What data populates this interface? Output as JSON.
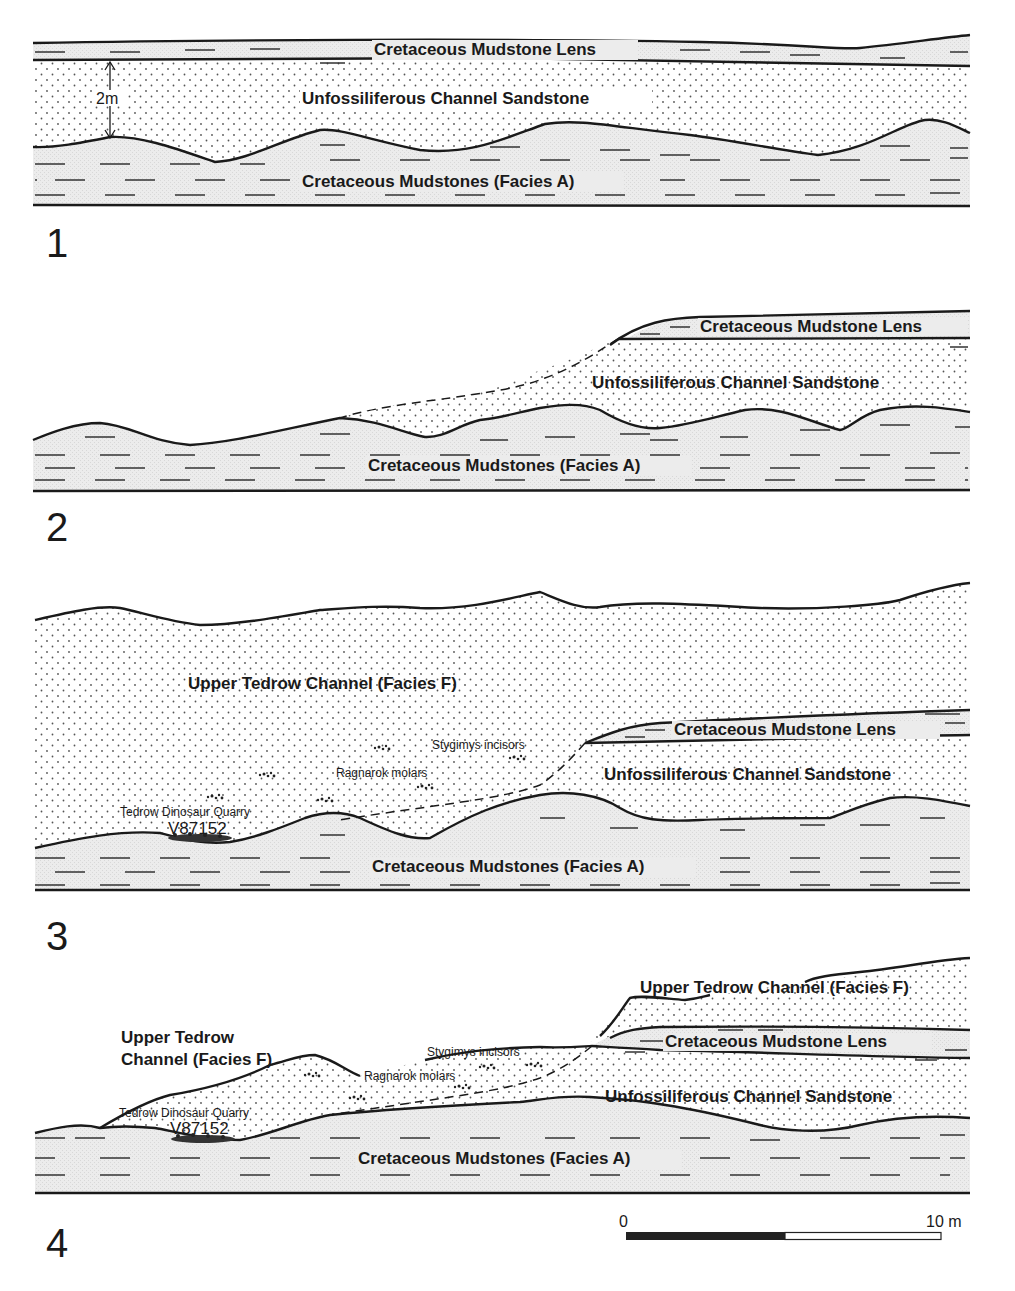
{
  "figure": {
    "panels": [
      {
        "number": "1",
        "labels": {
          "lens": "Cretaceous Mudstone Lens",
          "sandstone": "Unfossiliferous Channel Sandstone",
          "mudstones": "Cretaceous Mudstones (Facies A)",
          "thickness": "2m"
        }
      },
      {
        "number": "2",
        "labels": {
          "lens": "Cretaceous Mudstone Lens",
          "sandstone": "Unfossiliferous Channel Sandstone",
          "mudstones": "Cretaceous Mudstones (Facies A)"
        }
      },
      {
        "number": "3",
        "labels": {
          "upper_channel": "Upper Tedrow Channel (Facies F)",
          "lens": "Cretaceous Mudstone Lens",
          "sandstone": "Unfossiliferous Channel Sandstone",
          "mudstones": "Cretaceous Mudstones (Facies A)",
          "stygimys": "Stygimys incisors",
          "ragnarok": "Ragnarok molars",
          "quarry": "Tedrow Dinosaur Quarry",
          "locality": "V87152"
        }
      },
      {
        "number": "4",
        "labels": {
          "upper_channel_left_1": "Upper Tedrow",
          "upper_channel_left_2": "Channel (Facies F)",
          "upper_channel_right": "Upper Tedrow Channel (Facies F)",
          "lens": "Cretaceous Mudstone Lens",
          "sandstone": "Unfossiliferous Channel Sandstone",
          "mudstones": "Cretaceous Mudstones (Facies A)",
          "stygimys": "Stygimys incisors",
          "ragnarok": "Ragnarok molars",
          "quarry": "Tedrow Dinosaur Quarry",
          "locality": "V87152"
        }
      }
    ],
    "scale_bar": {
      "start_label": "0",
      "end_label": "10 m"
    },
    "colors": {
      "line": "#1a1a1a",
      "mudstone_fill": "#e6e6e6",
      "sandstone_dot": "#555555",
      "background": "#ffffff"
    }
  }
}
